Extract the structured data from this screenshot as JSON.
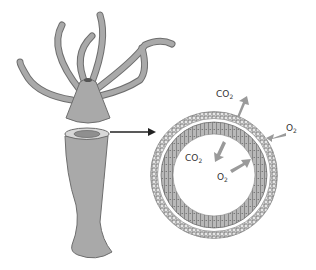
{
  "diagram": {
    "labels": {
      "co2_outer": {
        "base": "CO",
        "sub": "2"
      },
      "o2_outer": {
        "base": "O",
        "sub": "2"
      },
      "co2_inner": {
        "base": "CO",
        "sub": "2"
      },
      "o2_inner": {
        "base": "O",
        "sub": "2"
      }
    },
    "colors": {
      "body": "#a9a9a9",
      "body_stroke": "#6e6e6e",
      "arrow_gray": "#9a9a9a",
      "pointer_arrow": "#222222",
      "cell_layer": "#b5b5b5"
    }
  }
}
